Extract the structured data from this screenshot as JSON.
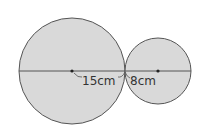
{
  "diagram": {
    "large_circle": {
      "label": "15cm",
      "cx": 72,
      "cy": 71,
      "r": 53
    },
    "small_circle": {
      "label": "8cm",
      "cx": 158,
      "cy": 71,
      "r": 33
    },
    "colors": {
      "fill": "#d9d9d9",
      "stroke": "#555555",
      "text": "#333333"
    }
  }
}
